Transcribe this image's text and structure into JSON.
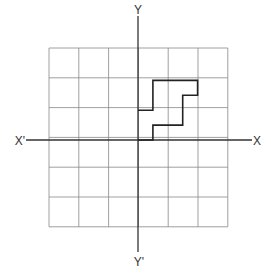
{
  "diagram": {
    "type": "coordinate-grid",
    "grid": {
      "columns": 6,
      "rows": 6,
      "cell_size_px": 29.8,
      "left_px": 49,
      "top_px": 48,
      "line_color": "#888888"
    },
    "axes": {
      "origin_px": [
        138,
        140
      ],
      "x_axis": {
        "from_px": 26,
        "to_px": 252,
        "label_pos": "X",
        "label_neg": "X'"
      },
      "y_axis": {
        "from_px": 16,
        "to_px": 252,
        "label_pos": "Y",
        "label_neg": "Y'"
      },
      "color": "#333333"
    },
    "shape": {
      "description": "Staircase-shaped polygon in first quadrant",
      "color": "#222222",
      "points_units": [
        [
          0,
          1
        ],
        [
          0.5,
          1
        ],
        [
          0.5,
          2
        ],
        [
          2,
          2
        ],
        [
          2,
          1.5
        ],
        [
          1.5,
          1.5
        ],
        [
          1.5,
          0.5
        ],
        [
          0.5,
          0.5
        ],
        [
          0.5,
          0
        ],
        [
          0,
          0
        ]
      ]
    }
  }
}
